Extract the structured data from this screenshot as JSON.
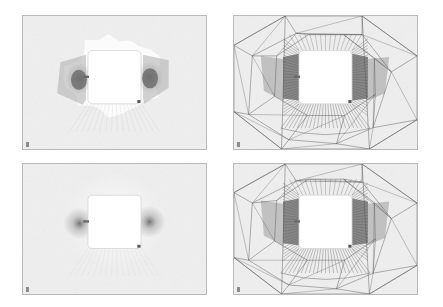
{
  "figure": {
    "title": "",
    "layout": "2x2 grid of simulation panels",
    "background_color": "#ffffff",
    "panel_fill_color": "#ededed",
    "panel_border_color": "#b9b9b9",
    "obstacle_color": "#ffffff",
    "mesh_line_color": "#555555",
    "wake_dark_color": "#6d6d6d",
    "wake_mid_color": "#a8a8a8",
    "plume_light_color": "#fbfbfb"
  },
  "panels": [
    {
      "id": "top-left",
      "name": "solution-field-coarse",
      "kind": "field",
      "row": 0,
      "column": 0,
      "x": 22,
      "y": 15,
      "width": 185,
      "height": 135,
      "corner_tick": true,
      "obstacle": {
        "x": 0.355,
        "y": 0.26,
        "width": 0.29,
        "height": 0.4
      },
      "features": [
        "light irregular halo surrounding obstacle",
        "two dark lobes on left and right flanks of obstacle",
        "mid-gray banded regions trailing the lobes",
        "small dark notch on left face of obstacle",
        "small dark marker at lower-right corner of obstacle"
      ]
    },
    {
      "id": "top-right",
      "name": "adaptive-mesh-coarse",
      "kind": "mesh",
      "row": 0,
      "column": 1,
      "x": 233,
      "y": 15,
      "width": 185,
      "height": 135,
      "corner_tick": true,
      "obstacle": {
        "x": 0.355,
        "y": 0.26,
        "width": 0.29,
        "height": 0.4
      },
      "features": [
        "large quadrilateral cells in far field",
        "radial triangular fan converging toward obstacle",
        "dense highly refined sliver elements along left and right faces",
        "refined fan of thin triangles below the obstacle",
        "shaded dark elements at left and right flanks"
      ]
    },
    {
      "id": "bottom-left",
      "name": "solution-field-refined",
      "kind": "field",
      "row": 1,
      "column": 0,
      "x": 22,
      "y": 163,
      "width": 185,
      "height": 132,
      "corner_tick": true,
      "obstacle": {
        "x": 0.355,
        "y": 0.24,
        "width": 0.29,
        "height": 0.41
      },
      "features": [
        "smooth diffuse gradient field",
        "soft dark lobes hugging the left and right faces of obstacle",
        "bright plume above obstacle corners",
        "no visible contour banding"
      ]
    },
    {
      "id": "bottom-right",
      "name": "adaptive-mesh-refined",
      "kind": "mesh",
      "row": 1,
      "column": 1,
      "x": 233,
      "y": 163,
      "width": 185,
      "height": 132,
      "corner_tick": true,
      "obstacle": {
        "x": 0.355,
        "y": 0.24,
        "width": 0.29,
        "height": 0.41
      },
      "features": [
        "large quadrilateral cells in far field",
        "radial triangular fan converging toward obstacle",
        "dense sliver elements along left and right faces",
        "fine triangular fan beneath the obstacle"
      ]
    }
  ]
}
